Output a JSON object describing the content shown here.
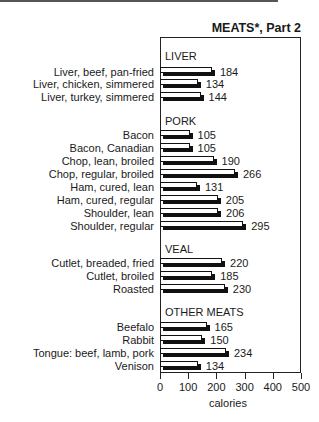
{
  "title": "MEATS*, Part 2",
  "xlabel": "calories",
  "groups": [
    {
      "name": "LIVER",
      "y": 50
    },
    {
      "name": "PORK",
      "y": 115
    },
    {
      "name": "VEAL",
      "y": 243
    },
    {
      "name": "OTHER MEATS",
      "y": 306
    }
  ],
  "rows": [
    {
      "label": "Liver, beef, pan-fried",
      "value": 184,
      "y": 71
    },
    {
      "label": "Liver, chicken, simmered",
      "value": 134,
      "y": 83
    },
    {
      "label": "Liver, turkey, simmered",
      "value": 144,
      "y": 96
    },
    {
      "label": "Bacon",
      "value": 105,
      "y": 134
    },
    {
      "label": "Bacon, Canadian",
      "value": 105,
      "y": 147
    },
    {
      "label": "Chop, lean, broiled",
      "value": 190,
      "y": 160
    },
    {
      "label": "Chop, regular, broiled",
      "value": 266,
      "y": 173
    },
    {
      "label": "Ham, cured, lean",
      "value": 131,
      "y": 186
    },
    {
      "label": "Ham, cured, regular",
      "value": 205,
      "y": 199
    },
    {
      "label": "Shoulder, lean",
      "value": 206,
      "y": 212
    },
    {
      "label": "Shoulder, regular",
      "value": 295,
      "y": 225
    },
    {
      "label": "Cutlet, breaded, fried",
      "value": 220,
      "y": 262
    },
    {
      "label": "Cutlet, broiled",
      "value": 185,
      "y": 275
    },
    {
      "label": "Roasted",
      "value": 230,
      "y": 288
    },
    {
      "label": "Beefalo",
      "value": 165,
      "y": 326
    },
    {
      "label": "Rabbit",
      "value": 150,
      "y": 339
    },
    {
      "label": "Tongue: beef, lamb, pork",
      "value": 234,
      "y": 352
    },
    {
      "label": "Venison",
      "value": 134,
      "y": 365
    }
  ],
  "ticks": [
    "0",
    "100",
    "200",
    "300",
    "400",
    "500"
  ],
  "chart_data": {
    "type": "bar",
    "orientation": "horizontal",
    "title": "MEATS*, Part 2",
    "xlabel": "calories",
    "ylabel": "",
    "xlim": [
      0,
      500
    ],
    "xticks": [
      0,
      100,
      200,
      300,
      400,
      500
    ],
    "grid": false,
    "legend": null,
    "groups": {
      "LIVER": [
        "Liver, beef, pan-fried",
        "Liver, chicken, simmered",
        "Liver, turkey, simmered"
      ],
      "PORK": [
        "Bacon",
        "Bacon, Canadian",
        "Chop, lean, broiled",
        "Chop, regular, broiled",
        "Ham, cured, lean",
        "Ham, cured, regular",
        "Shoulder, lean",
        "Shoulder, regular"
      ],
      "VEAL": [
        "Cutlet, breaded, fried",
        "Cutlet, broiled",
        "Roasted"
      ],
      "OTHER MEATS": [
        "Beefalo",
        "Rabbit",
        "Tongue: beef, lamb, pork",
        "Venison"
      ]
    },
    "categories": [
      "Liver, beef, pan-fried",
      "Liver, chicken, simmered",
      "Liver, turkey, simmered",
      "Bacon",
      "Bacon, Canadian",
      "Chop, lean, broiled",
      "Chop, regular, broiled",
      "Ham, cured, lean",
      "Ham, cured, regular",
      "Shoulder, lean",
      "Shoulder, regular",
      "Cutlet, breaded, fried",
      "Cutlet, broiled",
      "Roasted",
      "Beefalo",
      "Rabbit",
      "Tongue: beef, lamb, pork",
      "Venison"
    ],
    "values": [
      184,
      134,
      144,
      105,
      105,
      190,
      266,
      131,
      205,
      206,
      295,
      220,
      185,
      230,
      165,
      150,
      234,
      134
    ]
  }
}
